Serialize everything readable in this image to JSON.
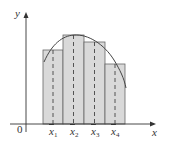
{
  "diagram": {
    "type": "midpoint-rule-riemann-sum",
    "axes": {
      "x_label": "x",
      "y_label": "y",
      "origin_label": "0"
    },
    "midpoints": [
      {
        "label": "x",
        "sub": "1"
      },
      {
        "label": "x",
        "sub": "2"
      },
      {
        "label": "x",
        "sub": "3"
      },
      {
        "label": "x",
        "sub": "4"
      }
    ],
    "colors": {
      "bar_fill": "#d9d9d9",
      "stroke": "#555555",
      "axis": "#333333"
    }
  }
}
